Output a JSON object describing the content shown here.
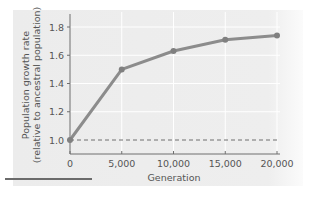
{
  "chart_data": {
    "type": "line",
    "title": "",
    "xlabel": "Generation",
    "ylabel_lines": [
      "Population growth rate",
      "(relative to ancestral population)"
    ],
    "x": [
      0,
      5000,
      10000,
      15000,
      20000
    ],
    "series": [
      {
        "name": "Population growth rate",
        "values": [
          1.0,
          1.5,
          1.63,
          1.71,
          1.74
        ]
      }
    ],
    "reference_line": {
      "y": 1.0,
      "style": "dashed"
    },
    "xlim": [
      0,
      20000
    ],
    "ylim": [
      1.0,
      1.8
    ],
    "x_ticks": [
      0,
      5000,
      10000,
      15000,
      20000
    ],
    "x_tick_labels": [
      "0",
      "5,000",
      "10,000",
      "15,000",
      "20,000"
    ],
    "y_ticks": [
      1.0,
      1.2,
      1.4,
      1.6,
      1.8
    ],
    "y_tick_labels": [
      "1.0",
      "1.2",
      "1.4",
      "1.6",
      "1.8"
    ],
    "grid": true,
    "legend": "none",
    "colors": {
      "line": "#8c8c8c",
      "marker": "#808080",
      "panel": "#ececec",
      "grid": "#ffffff",
      "axis": "#6e6e6e",
      "reference": "#6e6e6e"
    }
  }
}
